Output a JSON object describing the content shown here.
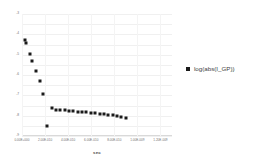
{
  "chart_data": {
    "type": "scatter",
    "title": "",
    "xlabel": "sec",
    "ylabel": "",
    "grid": true,
    "legend_position": "right",
    "xlim": [
      0.0,
      1.3e-09
    ],
    "ylim": [
      -9,
      -3
    ],
    "xticks": [
      0.0,
      2e-10,
      4e-10,
      6e-10,
      8e-10,
      1e-09,
      1.2e-09
    ],
    "xticklabels": [
      "0.00E+000",
      "2.00E-010",
      "4.00E-010",
      "6.00E-010",
      "8.00E-010",
      "1.00E-009",
      "1.20E-009"
    ],
    "yticks": [
      -3,
      -3.5,
      -4,
      -4.5,
      -5,
      -5.5,
      -6,
      -6.5,
      -7,
      -7.5,
      -8,
      -8.5,
      -9
    ],
    "yticklabels": [
      "-3",
      "",
      "-4",
      "",
      "-5",
      "",
      "-6",
      "",
      "-7",
      "",
      "-8",
      "",
      "-9"
    ],
    "series": [
      {
        "name": "log(abs(I_GP))",
        "marker": "square",
        "color": "#1a1a1a",
        "x": [
          2.5e-11,
          3.6e-11,
          6.5e-11,
          8.6e-11,
          1.2e-10,
          1.53e-10,
          1.85e-10,
          2.2e-10,
          2.58e-10,
          2.95e-10,
          3.32e-10,
          3.7e-10,
          4.08e-10,
          4.45e-10,
          4.83e-10,
          5.2e-10,
          5.58e-10,
          5.96e-10,
          6.34e-10,
          6.72e-10,
          7.1e-10,
          7.48e-10,
          7.86e-10,
          8.24e-10,
          8.62e-10,
          9e-10
        ],
        "y": [
          -4.28,
          -4.42,
          -4.98,
          -5.3,
          -5.8,
          -6.3,
          -6.95,
          -8.52,
          -7.62,
          -7.7,
          -7.72,
          -7.74,
          -7.76,
          -7.78,
          -7.8,
          -7.82,
          -7.84,
          -7.86,
          -7.88,
          -7.9,
          -7.93,
          -7.96,
          -7.99,
          -8.02,
          -8.06,
          -8.1
        ]
      }
    ]
  },
  "legend": {
    "entries": [
      {
        "label": "log(abs(I_GP))",
        "marker_color": "#1a1a1a"
      }
    ]
  },
  "axis": {
    "x_title": "sec"
  }
}
